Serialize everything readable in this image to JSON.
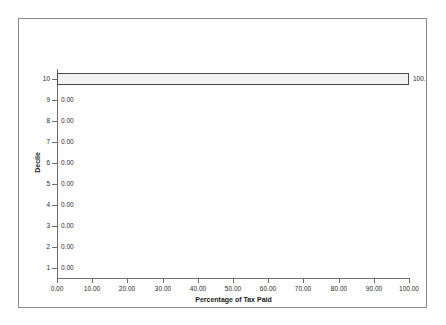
{
  "chart_data": {
    "type": "bar",
    "orientation": "horizontal",
    "title": "",
    "xlabel": "Percentage of Tax Paid",
    "ylabel": "Decile",
    "categories": [
      "1",
      "2",
      "3",
      "4",
      "5",
      "6",
      "7",
      "8",
      "9",
      "10"
    ],
    "values": [
      0.0,
      0.0,
      0.0,
      0.0,
      0.0,
      0.0,
      0.0,
      0.0,
      0.0,
      100.0
    ],
    "data_labels": [
      "0.00",
      "0.00",
      "0.00",
      "0.00",
      "0.00",
      "0.00",
      "0.00",
      "0.00",
      "0.00",
      "100.00"
    ],
    "data_label_rendered": [
      "0.00",
      "0.00",
      "0.00",
      "0.00",
      "0.00",
      "0.00",
      "0.00",
      "0.00",
      "0.00",
      "100."
    ],
    "xlim": [
      0,
      100
    ],
    "xticks": [
      0,
      10,
      20,
      30,
      40,
      50,
      60,
      70,
      80,
      90,
      100
    ],
    "xtick_labels": [
      "0.00",
      "10.00",
      "20.00",
      "30.00",
      "40.00",
      "50.00",
      "60.00",
      "70.00",
      "80.00",
      "90.00",
      "100.00"
    ],
    "ytick_labels": [
      "1",
      "2",
      "3",
      "4",
      "5",
      "6",
      "7",
      "8",
      "9",
      "10"
    ],
    "grid": false,
    "legend": false,
    "series": [
      {
        "name": "Percentage of Tax Paid",
        "values": [
          0.0,
          0.0,
          0.0,
          0.0,
          0.0,
          0.0,
          0.0,
          0.0,
          0.0,
          100.0
        ]
      }
    ],
    "colors": {
      "bar_fill": "#f2f2f2",
      "bar_pattern": "#a8a8a8",
      "bar_border": "#4a4a4a",
      "axis": "#6d6d6d",
      "frame": "#8a8a8a",
      "text": "#2b2b2b",
      "background": "#ffffff"
    }
  }
}
